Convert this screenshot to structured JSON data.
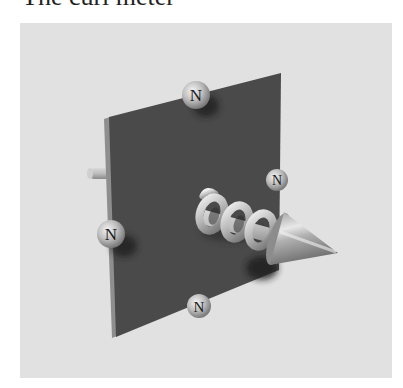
{
  "title": "The curl meter",
  "figure": {
    "background_color": "#e1e1e1",
    "plate_color": "#4a4a4a",
    "sphere_labels": [
      "N",
      "N",
      "N",
      "N"
    ],
    "components": [
      "square-plate",
      "axle-rod",
      "north-pole-spheres",
      "helix-coil",
      "arrow-cone"
    ]
  }
}
